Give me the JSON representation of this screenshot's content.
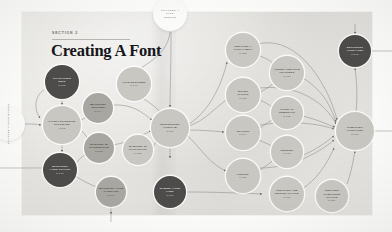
{
  "page": {
    "section_label": "SECTION 2",
    "title": "Creating A Font"
  },
  "chapters": [
    {
      "name": "chapter-top",
      "line1": "CHAPTER 4",
      "line2": "TYPE",
      "line3": "DESIGN"
    },
    {
      "name": "chapter-left",
      "line1": "CHAPTER 3",
      "line2": "TYPE BASICS"
    }
  ],
  "diagram": {
    "type": "flowchart",
    "nodes": [
      {
        "id": "n1",
        "label": "CHARACTER",
        "label2": "SETS",
        "page": "P.108",
        "tone": "dark",
        "x": 62,
        "y": 82,
        "r": 17
      },
      {
        "id": "n2",
        "label": "TYPEFACE DESIGN",
        "label2": "SOFTWARE",
        "page": "P.112",
        "tone": "light",
        "x": 62,
        "y": 125,
        "r": 19
      },
      {
        "id": "n3",
        "label": "MANAGING",
        "label2": "YOUR GLYPHS",
        "page": "P.148",
        "tone": "dark",
        "x": 60,
        "y": 170,
        "r": 17
      },
      {
        "id": "n4",
        "label": "IMPORTING",
        "label2": "VECTORS",
        "page": "P.144",
        "tone": "mid",
        "x": 98,
        "y": 108,
        "r": 15
      },
      {
        "id": "n5",
        "label": "WORKING IN",
        "label2": "ILLUSTRATOR",
        "page": "P.132",
        "tone": "mid",
        "x": 99,
        "y": 148,
        "r": 15
      },
      {
        "id": "n6",
        "label": "WORKING IN",
        "label2": "PHOTOSHOP",
        "page": "P.138",
        "tone": "light",
        "x": 138,
        "y": 150,
        "r": 15
      },
      {
        "id": "n7",
        "label": "TYPE DESIGNER",
        "label2": "",
        "page": "P.140",
        "tone": "light",
        "x": 134,
        "y": 84,
        "r": 17
      },
      {
        "id": "n8",
        "label": "IMPORTING YOUR",
        "label2": "TYPEFACE",
        "page": "P.174",
        "tone": "mid",
        "x": 111,
        "y": 192,
        "r": 15
      },
      {
        "id": "n9",
        "label": "INTRODUCING",
        "label2": "FONTLAB",
        "page": "P.116",
        "tone": "light",
        "x": 170,
        "y": 128,
        "r": 19
      },
      {
        "id": "n10",
        "label": "NAMING YOUR",
        "label2": "FONT",
        "page": "P.184",
        "tone": "dark",
        "x": 170,
        "y": 192,
        "r": 16
      },
      {
        "id": "n11",
        "label": "CREATING A",
        "label2": "TYPE FAMILY",
        "page": "P.158",
        "tone": "light",
        "x": 243,
        "y": 50,
        "r": 17
      },
      {
        "id": "n12",
        "label": "BOLDS",
        "label2": "ITALICS",
        "page": "P.162",
        "tone": "light",
        "x": 243,
        "y": 95,
        "r": 17
      },
      {
        "id": "n13",
        "label": "SPACING",
        "label2": "",
        "page": "P.164",
        "tone": "light",
        "x": 243,
        "y": 133,
        "r": 17
      },
      {
        "id": "n14",
        "label": "HINTING",
        "label2": "",
        "page": "P.186",
        "tone": "light",
        "x": 243,
        "y": 176,
        "r": 17
      },
      {
        "id": "n15",
        "label": "ADDING CREATIVE",
        "label2": "FEATURES",
        "page": "P.176",
        "tone": "light",
        "x": 287,
        "y": 73,
        "r": 17
      },
      {
        "id": "n16",
        "label": "TYPES OF",
        "label2": "NUMERALS",
        "page": "P.168",
        "tone": "light",
        "x": 287,
        "y": 113,
        "r": 16
      },
      {
        "id": "n17",
        "label": "KERNING",
        "label2": "",
        "page": "P.180",
        "tone": "light",
        "x": 287,
        "y": 152,
        "r": 16
      },
      {
        "id": "n18",
        "label": "CREATING AND",
        "label2": "EDITING GLYPHS",
        "page": "P.150",
        "tone": "light",
        "x": 287,
        "y": 194,
        "r": 17
      },
      {
        "id": "n19",
        "label": "CREATING COMPOSITE",
        "label2": "GLYPHS",
        "page": "P.156",
        "tone": "light",
        "x": 332,
        "y": 196,
        "r": 16
      },
      {
        "id": "n20",
        "label": "EXPORTING",
        "label2": "YOUR FONT",
        "page": "P.192",
        "tone": "dark",
        "x": 355,
        "y": 51,
        "r": 16
      },
      {
        "id": "n21",
        "label": "COMPILING",
        "label2": "YOUR FONT",
        "page": "P.170",
        "tone": "light",
        "x": 355,
        "y": 131,
        "r": 19
      }
    ],
    "edge_count": 38
  },
  "colors": {
    "paper": "#e6e5e1",
    "ink": "#15151a",
    "node_dark": "#4e4c4a",
    "node_mid": "#a9a7a2",
    "node_light": "#c9c8c3",
    "edge": "#8e8c87"
  }
}
